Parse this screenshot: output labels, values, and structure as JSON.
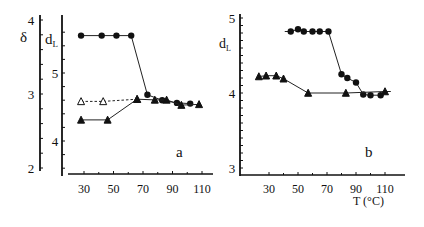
{
  "figure": {
    "x_axis_title": "T (°C)",
    "panels": [
      {
        "id": "a",
        "label": "a",
        "left_axis": {
          "title": "δ",
          "ticks": [
            "4",
            "3",
            "2"
          ]
        },
        "inner_axis": {
          "title": "d",
          "subscript": "L",
          "ticks": [
            "5",
            "4"
          ]
        },
        "x_ticks": [
          "30",
          "50",
          "70",
          "90",
          "110"
        ]
      },
      {
        "id": "b",
        "label": "b",
        "left_axis": {
          "title": "d",
          "subscript": "L",
          "ticks": [
            "5",
            "4",
            "3"
          ]
        },
        "x_ticks": [
          "30",
          "50",
          "70",
          "90",
          "110"
        ]
      }
    ]
  },
  "chart_data": [
    {
      "type": "line",
      "title": "a",
      "xlabel": "T (°C)",
      "ylabel": "δ (outer axis), d_L (inner axis)",
      "xlim": [
        20,
        115
      ],
      "x_ticks": [
        30,
        50,
        70,
        90,
        110
      ],
      "y_axes": {
        "delta": {
          "range": [
            2,
            4
          ],
          "ticks": [
            2,
            3,
            4
          ]
        },
        "d_L": {
          "range": [
            3.5,
            5.7
          ],
          "ticks": [
            4,
            5
          ]
        }
      },
      "grid": false,
      "legend": "none",
      "series": [
        {
          "name": "d_L (filled circles)",
          "axis": "d_L",
          "marker": "circle-filled",
          "line": "solid",
          "x": [
            28,
            42,
            52,
            62,
            73,
            83,
            93,
            102
          ],
          "y": [
            5.55,
            5.55,
            5.55,
            5.55,
            4.68,
            4.6,
            4.56,
            4.55
          ]
        },
        {
          "name": "δ (open triangles)",
          "axis": "delta",
          "marker": "triangle-open",
          "line": "dashed",
          "x": [
            28,
            43,
            66
          ],
          "y": [
            2.9,
            2.9,
            2.93
          ]
        },
        {
          "name": "δ (filled triangles)",
          "axis": "delta",
          "marker": "triangle-filled",
          "line": "solid",
          "x": [
            28,
            46,
            66,
            78,
            86,
            96,
            108
          ],
          "y": [
            2.65,
            2.65,
            2.93,
            2.92,
            2.92,
            2.85,
            2.86
          ]
        }
      ],
      "annotations": [
        "a"
      ]
    },
    {
      "type": "line",
      "title": "b",
      "xlabel": "T (°C)",
      "ylabel": "d_L",
      "xlim": [
        20,
        115
      ],
      "ylim": [
        3,
        5
      ],
      "x_ticks": [
        30,
        50,
        70,
        90,
        110
      ],
      "y_ticks": [
        3,
        4,
        5
      ],
      "grid": false,
      "legend": "none",
      "series": [
        {
          "name": "filled circles",
          "marker": "circle-filled",
          "line": "solid",
          "x": [
            45,
            50,
            54,
            60,
            65,
            71,
            80,
            84,
            90,
            95,
            100,
            107
          ],
          "y": [
            4.82,
            4.85,
            4.82,
            4.82,
            4.82,
            4.82,
            4.25,
            4.2,
            4.14,
            3.98,
            3.97,
            3.97
          ]
        },
        {
          "name": "filled triangles",
          "marker": "triangle-filled",
          "line": "solid",
          "x": [
            23,
            28,
            35,
            40,
            57,
            83,
            110
          ],
          "y": [
            4.22,
            4.23,
            4.23,
            4.19,
            4.0,
            4.0,
            4.02
          ]
        }
      ],
      "annotations": [
        "b"
      ]
    }
  ]
}
